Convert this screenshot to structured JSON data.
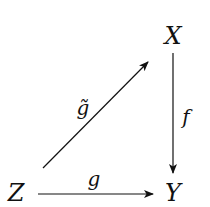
{
  "diagram": {
    "type": "commutative-diagram",
    "nodes": [
      {
        "id": "X",
        "label": "X",
        "x": 173,
        "y": 36
      },
      {
        "id": "Y",
        "label": "Y",
        "x": 173,
        "y": 193
      },
      {
        "id": "Z",
        "label": "Z",
        "x": 16,
        "y": 193
      }
    ],
    "edges": [
      {
        "from": "Z",
        "to": "X",
        "label": "g̃",
        "name": "g-tilde"
      },
      {
        "from": "X",
        "to": "Y",
        "label": "f",
        "name": "f"
      },
      {
        "from": "Z",
        "to": "Y",
        "label": "g",
        "name": "g"
      }
    ],
    "colors": {
      "ink": "#111111",
      "background": "#ffffff"
    }
  }
}
